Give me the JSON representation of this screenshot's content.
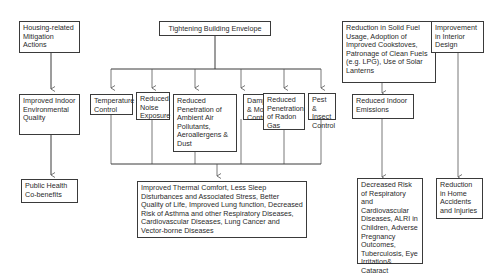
{
  "diagram": {
    "left_column": {
      "mitigation": "Housing-related Mitigation Actions",
      "environmental_quality": "Improved Indoor Environmental Quality",
      "cobenefits": "Public Health Co-benefits"
    },
    "envelope": {
      "title": "Tightening Building Envelope",
      "effects": [
        "Temperature Control",
        "Reduced Noise Exposure",
        "Reduced Penetration of Ambient Air Pollutants, Aeroallergens & Dust",
        "Dampness & Mould Control",
        "Reduced Penetration of Radon Gas",
        "Pest & Insect Control"
      ],
      "outcome": "Improved Thermal Comfort, Less Sleep Disturbances and Associated Stress, Better Quality of Life, Improved Lung function, Decreased Risk of Asthma and other Respiratory Diseases, Cardiovascular Diseases, Lung Cancer and Vector-borne Diseases"
    },
    "fuel": {
      "title": "Reduction in Solid Fuel Usage, Adoption of Improved Cookstoves, Patronage of Clean Fuels (e.g. LPG), Use of Solar Lanterns",
      "effect": "Reduced Indoor Emissions",
      "outcome": "Decreased Risk of Respiratory and Cardiovascular Diseases, ALRI in Children, Adverse Pregnancy Outcomes, Tuberculosis, Eye Irritation& Cataract"
    },
    "interior": {
      "title": "Improvement in Interior Design",
      "outcome": "Reduction in Home Accidents and Injuries"
    }
  }
}
